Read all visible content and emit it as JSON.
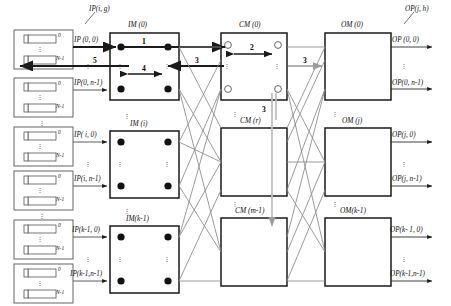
{
  "diagram": {
    "colors": {
      "box_stroke": "#1a1a1a",
      "ip_box_stroke": "#555555",
      "link_gray": "#7e7e7e",
      "bold_arrow": "#1a1a1a",
      "gray_arrow": "#9a9a9a",
      "dot_fill": "#111111",
      "circle_fill": "#ffffff",
      "text": "#111111"
    },
    "input_ports": {
      "box_label_top": "0",
      "box_label_bottom": "N-1",
      "count_visible": 6
    },
    "stages": {
      "input_modules": [
        {
          "name": "IM (0)"
        },
        {
          "name": "IM (i)"
        },
        {
          "name": "IM(k-1)"
        }
      ],
      "central_modules": [
        {
          "name": "CM (0)"
        },
        {
          "name": "CM (r)"
        },
        {
          "name": "CM (m-1)"
        }
      ],
      "output_modules": [
        {
          "name": "OM (0)"
        },
        {
          "name": "OM (j)"
        },
        {
          "name": "OM(k-1)"
        }
      ]
    },
    "input_link_labels": [
      "IP (0, 0)",
      "IP(0, n-1)",
      "IP( i, 0)",
      "IP(i, n-1)",
      "IP(k-1, 0)",
      "IP(k-1,n-1)"
    ],
    "output_link_labels": [
      "OP (0, 0)",
      "OP(0, n-1)",
      "OP(j, 0)",
      "OP(j, n-1)",
      "OP(k- 1, 0)",
      "OP(k-1,n-1)"
    ],
    "callouts": {
      "input_pointer": "IP(i, g)",
      "output_pointer": "OP(j, h)"
    },
    "step_numbers": {
      "one": "1",
      "two": "2",
      "three_a": "3",
      "three_b": "3",
      "three_c": "3",
      "four": "4",
      "five": "5"
    }
  }
}
